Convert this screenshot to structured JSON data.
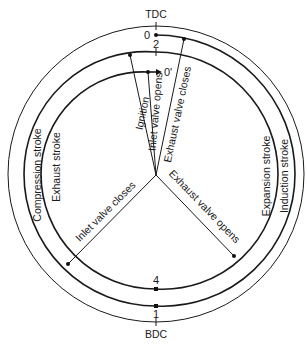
{
  "diagram": {
    "markers": {
      "tdc": "TDC",
      "bdc": "BDC"
    },
    "points": {
      "p0": "0",
      "p1": "1",
      "p2": "2",
      "p4": "4",
      "p0prime": "0'"
    },
    "strokes": {
      "induction": "Induction stroke",
      "compression": "Compression stroke",
      "expansion": "Expansion stroke",
      "exhaust": "Exhaust stroke"
    },
    "events": {
      "ignition": "Ignition",
      "inlet_opens": "Inlet valve opens",
      "exhaust_closes": "Exhaust valve closes",
      "inlet_closes": "Inlet valve closes",
      "exhaust_opens": "Exhaust valve opens"
    },
    "colors": {
      "line": "#1a1a1a",
      "background": "#ffffff"
    }
  }
}
